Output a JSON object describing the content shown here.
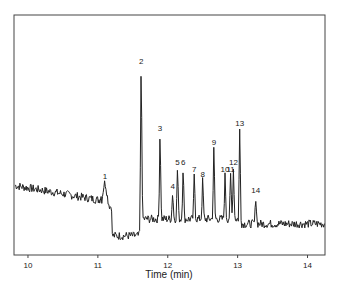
{
  "chart_data": {
    "type": "line",
    "title": "",
    "xlabel": "Time (min)",
    "ylabel": "",
    "xlim": [
      9.8,
      14.25
    ],
    "grid": false,
    "x_ticks": [
      10,
      11,
      12,
      13,
      14
    ],
    "peaks": [
      {
        "label": "1",
        "time": 11.1,
        "height": 0.3
      },
      {
        "label": "2",
        "time": 11.62,
        "height": 0.78
      },
      {
        "label": "3",
        "time": 11.89,
        "height": 0.5
      },
      {
        "label": "4",
        "time": 12.07,
        "height": 0.26
      },
      {
        "label": "5",
        "time": 12.14,
        "height": 0.36
      },
      {
        "label": "6",
        "time": 12.22,
        "height": 0.36
      },
      {
        "label": "7",
        "time": 12.38,
        "height": 0.33
      },
      {
        "label": "8",
        "time": 12.5,
        "height": 0.31
      },
      {
        "label": "9",
        "time": 12.66,
        "height": 0.44
      },
      {
        "label": "10",
        "time": 12.82,
        "height": 0.33
      },
      {
        "label": "11",
        "time": 12.9,
        "height": 0.33
      },
      {
        "label": "12",
        "time": 12.94,
        "height": 0.36
      },
      {
        "label": "13",
        "time": 13.03,
        "height": 0.52
      },
      {
        "label": "14",
        "time": 13.26,
        "height": 0.24
      }
    ]
  }
}
